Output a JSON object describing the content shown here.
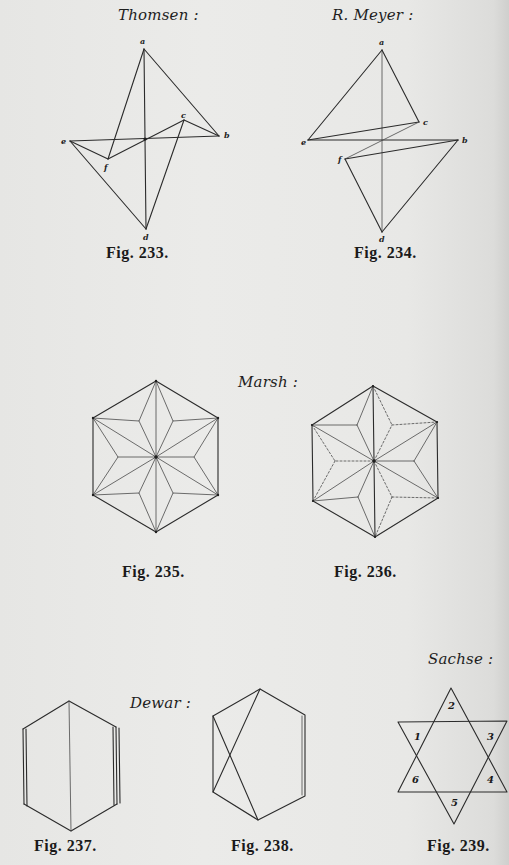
{
  "page": {
    "background": "#e9e9e7",
    "ink": "#2b2b2b"
  },
  "figures": [
    {
      "id": "fig233",
      "author": "Thomsen :",
      "caption": "Fig. 233.",
      "vertex_labels": {
        "a": "a",
        "b": "b",
        "c": "c",
        "d": "d",
        "e": "e",
        "f": "f"
      }
    },
    {
      "id": "fig234",
      "author": "R.  Meyer :",
      "caption": "Fig. 234.",
      "vertex_labels": {
        "a": "a",
        "b": "b",
        "c": "c",
        "d": "d",
        "e": "e",
        "f": "f"
      }
    },
    {
      "id": "fig235",
      "group_author": "Marsh :",
      "caption": "Fig. 235."
    },
    {
      "id": "fig236",
      "caption": "Fig. 236."
    },
    {
      "id": "fig237",
      "group_author": "Dewar :",
      "caption": "Fig. 237."
    },
    {
      "id": "fig238",
      "caption": "Fig. 238."
    },
    {
      "id": "fig239",
      "author": "Sachse :",
      "caption": "Fig. 239.",
      "region_numbers": [
        "1",
        "2",
        "3",
        "4",
        "5",
        "6"
      ]
    }
  ]
}
